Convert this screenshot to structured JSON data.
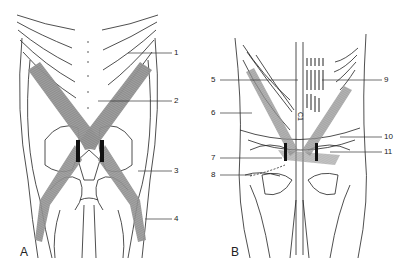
{
  "figure": {
    "panels": [
      {
        "id": "A",
        "label": "A",
        "callouts": [
          {
            "number": "1"
          },
          {
            "number": "2"
          },
          {
            "number": "3"
          },
          {
            "number": "4"
          }
        ]
      },
      {
        "id": "B",
        "label": "B",
        "callouts": [
          {
            "number": "5"
          },
          {
            "number": "6"
          },
          {
            "number": "7"
          },
          {
            "number": "8"
          },
          {
            "number": "9"
          },
          {
            "number": "10"
          },
          {
            "number": "11"
          }
        ]
      }
    ],
    "midline_marker": "C1",
    "colors": {
      "line": "#222222",
      "muscle_band": "#8a8a8a",
      "muscle_dark": "#111111",
      "background": "#ffffff"
    }
  }
}
